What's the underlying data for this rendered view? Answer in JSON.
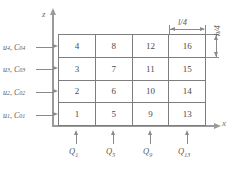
{
  "figure": {
    "type": "diagram",
    "axes": {
      "vertical_label": "z",
      "horizontal_label": "x"
    },
    "grid": {
      "rows": 4,
      "cols": 4,
      "cells_by_row_top_to_bottom": [
        [
          "4",
          "8",
          "12",
          "16"
        ],
        [
          "3",
          "7",
          "11",
          "15"
        ],
        [
          "2",
          "6",
          "10",
          "14"
        ],
        [
          "1",
          "5",
          "9",
          "13"
        ]
      ]
    },
    "left_labels": [
      {
        "u": "u",
        "u_sub": "4",
        "c": "C",
        "c_sub": "04",
        "text": "u4, C04"
      },
      {
        "u": "u",
        "u_sub": "3",
        "c": "C",
        "c_sub": "03",
        "text": "u3, C03"
      },
      {
        "u": "u",
        "u_sub": "2",
        "c": "C",
        "c_sub": "02",
        "text": "u2, C02"
      },
      {
        "u": "u",
        "u_sub": "1",
        "c": "C",
        "c_sub": "01",
        "text": "u1, C01"
      }
    ],
    "bottom_labels": [
      {
        "symbol": "Q",
        "sub": "1"
      },
      {
        "symbol": "Q",
        "sub": "5"
      },
      {
        "symbol": "Q",
        "sub": "9"
      },
      {
        "symbol": "Q",
        "sub": "13"
      }
    ],
    "dimensions": {
      "horizontal": "l/4",
      "vertical": "h/4"
    },
    "colors": {
      "grid_line": "#7d7d7d",
      "axis": "#9a9a9a",
      "text": "#5a5a5a",
      "background": "#ffffff"
    }
  }
}
